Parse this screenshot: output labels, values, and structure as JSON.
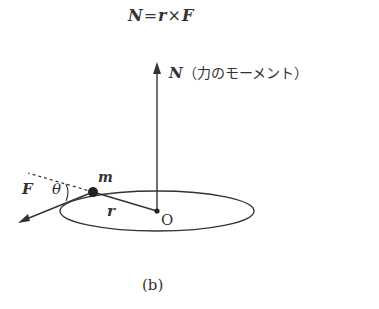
{
  "formula": {
    "N": "N",
    "eq": "=",
    "r": "r",
    "times": "×",
    "F": "F"
  },
  "labels": {
    "N_vector": "N",
    "N_description": "（力のモーメント）",
    "mass": "m",
    "angle": "θ",
    "force": "F",
    "radius": "r",
    "origin": "O",
    "caption": "(b)"
  },
  "colors": {
    "ink": "#333333",
    "background": "#ffffff"
  }
}
